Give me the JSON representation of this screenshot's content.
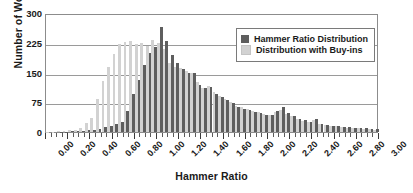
{
  "chart_data": {
    "type": "bar",
    "title": "",
    "xlabel": "Hammer Ratio",
    "ylabel": "Number of Works",
    "xlim": [
      0.0,
      3.0
    ],
    "ylim": [
      0,
      300
    ],
    "ytick_values": [
      0,
      75,
      150,
      225,
      300
    ],
    "ytick_labels": [
      "0",
      "75",
      "150",
      "225",
      "300"
    ],
    "xtick_values": [
      0.0,
      0.2,
      0.4,
      0.6,
      0.8,
      1.0,
      1.2,
      1.4,
      1.6,
      1.8,
      2.0,
      2.2,
      2.4,
      2.6,
      2.8,
      3.0
    ],
    "xtick_labels": [
      "0.00",
      "0.20",
      "0.40",
      "0.60",
      "0.80",
      "1.00",
      "1.20",
      "1.40",
      "1.60",
      "1.80",
      "2.00",
      "2.20",
      "2.40",
      "2.60",
      "2.80",
      "3.00"
    ],
    "xtick_label_rotation": -45,
    "minor_tick_step": 0.05,
    "bin_width": 0.05,
    "grid": true,
    "grid_axis": "y",
    "legend_position": "upper right",
    "bin_centers": [
      0.025,
      0.075,
      0.125,
      0.175,
      0.225,
      0.275,
      0.325,
      0.375,
      0.425,
      0.475,
      0.525,
      0.575,
      0.625,
      0.675,
      0.725,
      0.775,
      0.825,
      0.875,
      0.925,
      0.975,
      1.025,
      1.075,
      1.125,
      1.175,
      1.225,
      1.275,
      1.325,
      1.375,
      1.425,
      1.475,
      1.525,
      1.575,
      1.625,
      1.675,
      1.725,
      1.775,
      1.825,
      1.875,
      1.925,
      1.975,
      2.025,
      2.075,
      2.125,
      2.175,
      2.225,
      2.275,
      2.325,
      2.375,
      2.425,
      2.475,
      2.525,
      2.575,
      2.625,
      2.675,
      2.725,
      2.775,
      2.825,
      2.875,
      2.925,
      2.975
    ],
    "series": [
      {
        "name": "Hammer Ratio Distribution",
        "color": "#5e5e5e",
        "values": [
          0,
          0,
          1,
          1,
          2,
          2,
          3,
          4,
          5,
          8,
          12,
          14,
          20,
          26,
          52,
          95,
          130,
          170,
          200,
          215,
          265,
          230,
          195,
          175,
          160,
          148,
          148,
          118,
          110,
          113,
          95,
          88,
          80,
          72,
          62,
          58,
          55,
          50,
          48,
          44,
          42,
          52,
          63,
          48,
          40,
          34,
          30,
          26,
          34,
          20,
          18,
          16,
          15,
          13,
          12,
          11,
          10,
          9,
          8,
          7
        ]
      },
      {
        "name": "Distribution with Buy-ins",
        "color": "#d2d2d2",
        "values": [
          1,
          1,
          2,
          3,
          4,
          6,
          10,
          22,
          35,
          82,
          128,
          165,
          196,
          222,
          228,
          230,
          222,
          225,
          218,
          232,
          225,
          210,
          175,
          165,
          162,
          155,
          150,
          125,
          112,
          115,
          100,
          92,
          84,
          75,
          66,
          62,
          58,
          54,
          50,
          46,
          44,
          50,
          55,
          46,
          40,
          32,
          28,
          24,
          30,
          19,
          17,
          15,
          14,
          12,
          11,
          10,
          9,
          8,
          7,
          6
        ]
      }
    ]
  },
  "legend": {
    "items": [
      {
        "label": "Hammer Ratio Distribution",
        "color": "#5e5e5e"
      },
      {
        "label": "Distribution with Buy-ins",
        "color": "#d2d2d2"
      }
    ]
  }
}
